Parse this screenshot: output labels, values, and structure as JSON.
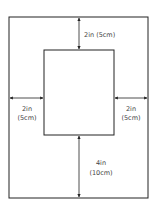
{
  "diagram": {
    "title": "",
    "colors": {
      "stroke": "#222222",
      "text": "#444444",
      "background": "#ffffff"
    },
    "outer": {
      "x": 9,
      "y": 17,
      "width": 139,
      "height": 181
    },
    "inner": {
      "x": 44,
      "y": 50,
      "width": 70,
      "height": 85
    },
    "labels": {
      "top": "2in (5cm)",
      "left_line1": "2in",
      "left_line2": "(5cm)",
      "right_line1": "2in",
      "right_line2": "(5cm)",
      "bottom_line1": "4in",
      "bottom_line2": "(10cm)"
    }
  }
}
